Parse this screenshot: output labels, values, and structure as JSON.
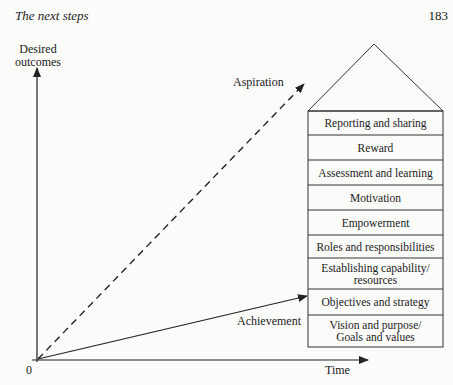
{
  "header": {
    "running_title": "The next steps",
    "page_number": "183"
  },
  "axes": {
    "y_label_line1": "Desired",
    "y_label_line2": "outcomes",
    "x_label": "Time",
    "origin": "0"
  },
  "lines": {
    "aspiration": "Aspiration",
    "achievement": "Achievement"
  },
  "house": {
    "rows": [
      {
        "label": "Reporting and sharing"
      },
      {
        "label": "Reward"
      },
      {
        "label": "Assessment and learning"
      },
      {
        "label": "Motivation"
      },
      {
        "label": "Empowerment"
      },
      {
        "label": "Roles and responsibilities"
      },
      {
        "label": "Establishing capability/ resources"
      },
      {
        "label": "Objectives and strategy"
      },
      {
        "label": "Vision and purpose/ Goals and values"
      }
    ]
  }
}
